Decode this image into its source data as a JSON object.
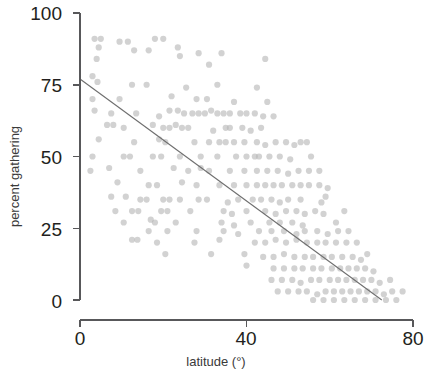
{
  "chart_data": {
    "type": "scatter",
    "title": "",
    "xlabel": "latitude (°)",
    "ylabel": "percent gathering",
    "xlim": [
      0,
      80
    ],
    "ylim": [
      0,
      100
    ],
    "xticks": [
      0,
      40,
      80
    ],
    "yticks": [
      0,
      25,
      50,
      75,
      100
    ],
    "xtick_labels": [
      "0",
      "40",
      "80"
    ],
    "ytick_labels": [
      "0",
      "25",
      "50",
      "75",
      "100"
    ],
    "grid": false,
    "legend": "none",
    "point_color": "#b6b6b6",
    "point_opacity": 0.62,
    "point_radius": 3.1,
    "axis_color": "#58585a",
    "trend_color": "#6e6e6e",
    "trendline": {
      "type": "linear",
      "x_start": 0,
      "y_start": 77,
      "x_end": 72.5,
      "y_end": 0,
      "slope": -1.062,
      "intercept": 77
    },
    "series": [
      {
        "name": "populations",
        "points": [
          [
            3.5,
            91
          ],
          [
            5.0,
            91
          ],
          [
            4.0,
            84
          ],
          [
            4.5,
            88
          ],
          [
            9.5,
            90
          ],
          [
            11.5,
            90
          ],
          [
            18.0,
            91
          ],
          [
            20.0,
            91
          ],
          [
            13.0,
            87
          ],
          [
            16.5,
            87
          ],
          [
            23.5,
            88
          ],
          [
            24.0,
            85
          ],
          [
            28.5,
            86
          ],
          [
            34.0,
            86
          ],
          [
            31.0,
            82
          ],
          [
            44.5,
            84
          ],
          [
            3.0,
            78
          ],
          [
            4.2,
            76
          ],
          [
            3.0,
            70
          ],
          [
            12.5,
            75
          ],
          [
            16.0,
            75
          ],
          [
            25.5,
            74
          ],
          [
            33.0,
            75
          ],
          [
            42.5,
            74
          ],
          [
            9.5,
            70
          ],
          [
            22.0,
            71
          ],
          [
            28.0,
            70
          ],
          [
            30.5,
            70
          ],
          [
            37.0,
            69
          ],
          [
            45.0,
            69
          ],
          [
            3.5,
            66
          ],
          [
            7.5,
            65
          ],
          [
            13.5,
            65
          ],
          [
            19.0,
            64
          ],
          [
            21.5,
            66
          ],
          [
            23.5,
            66
          ],
          [
            25.0,
            65
          ],
          [
            27.0,
            65
          ],
          [
            28.5,
            65
          ],
          [
            30.0,
            65
          ],
          [
            31.5,
            66
          ],
          [
            33.0,
            65
          ],
          [
            34.5,
            65
          ],
          [
            36.0,
            65
          ],
          [
            38.5,
            65
          ],
          [
            40.0,
            65
          ],
          [
            42.0,
            65
          ],
          [
            44.0,
            64
          ],
          [
            46.5,
            64
          ],
          [
            6.5,
            61
          ],
          [
            8.0,
            61
          ],
          [
            10.5,
            60
          ],
          [
            17.5,
            61
          ],
          [
            20.0,
            60
          ],
          [
            21.5,
            60
          ],
          [
            23.0,
            61
          ],
          [
            24.5,
            60
          ],
          [
            26.0,
            60
          ],
          [
            32.0,
            59
          ],
          [
            36.0,
            60
          ],
          [
            39.0,
            60
          ],
          [
            41.0,
            59
          ],
          [
            43.5,
            60
          ],
          [
            4.5,
            56
          ],
          [
            13.0,
            55
          ],
          [
            19.0,
            56
          ],
          [
            20.5,
            55
          ],
          [
            27.5,
            55
          ],
          [
            31.0,
            55
          ],
          [
            33.5,
            55
          ],
          [
            35.0,
            55
          ],
          [
            37.0,
            55
          ],
          [
            39.5,
            55
          ],
          [
            42.5,
            55
          ],
          [
            44.5,
            54
          ],
          [
            47.0,
            55
          ],
          [
            49.5,
            55
          ],
          [
            51.5,
            54
          ],
          [
            53.0,
            55
          ],
          [
            54.5,
            55
          ],
          [
            3.0,
            50
          ],
          [
            10.5,
            50
          ],
          [
            12.0,
            50
          ],
          [
            17.5,
            50
          ],
          [
            19.5,
            50
          ],
          [
            24.0,
            50
          ],
          [
            29.0,
            50
          ],
          [
            33.0,
            50
          ],
          [
            37.5,
            50
          ],
          [
            40.0,
            50
          ],
          [
            42.0,
            50
          ],
          [
            45.5,
            50
          ],
          [
            48.0,
            50
          ],
          [
            50.5,
            49
          ],
          [
            2.5,
            45
          ],
          [
            14.5,
            45
          ],
          [
            22.5,
            46
          ],
          [
            26.0,
            45
          ],
          [
            31.0,
            45
          ],
          [
            36.0,
            45
          ],
          [
            39.5,
            45
          ],
          [
            42.5,
            45
          ],
          [
            45.0,
            45
          ],
          [
            47.5,
            45
          ],
          [
            50.0,
            44
          ],
          [
            52.5,
            45
          ],
          [
            55.0,
            45
          ],
          [
            9.0,
            41
          ],
          [
            16.5,
            40
          ],
          [
            18.5,
            40
          ],
          [
            24.5,
            41
          ],
          [
            28.0,
            40
          ],
          [
            33.5,
            40
          ],
          [
            37.0,
            40
          ],
          [
            40.0,
            40
          ],
          [
            42.5,
            40
          ],
          [
            44.5,
            40
          ],
          [
            46.5,
            40
          ],
          [
            48.5,
            40
          ],
          [
            51.0,
            40
          ],
          [
            53.0,
            40
          ],
          [
            55.0,
            40
          ],
          [
            57.5,
            40
          ],
          [
            59.5,
            39
          ],
          [
            14.5,
            35
          ],
          [
            16.0,
            35
          ],
          [
            20.0,
            35
          ],
          [
            21.5,
            35
          ],
          [
            28.5,
            35
          ],
          [
            30.5,
            35
          ],
          [
            35.5,
            34
          ],
          [
            38.0,
            35
          ],
          [
            41.5,
            35
          ],
          [
            43.5,
            35
          ],
          [
            46.0,
            35
          ],
          [
            48.0,
            34
          ],
          [
            12.5,
            31
          ],
          [
            14.0,
            31
          ],
          [
            19.5,
            31
          ],
          [
            21.0,
            31
          ],
          [
            34.5,
            31
          ],
          [
            36.5,
            30
          ],
          [
            40.0,
            31
          ],
          [
            44.5,
            31
          ],
          [
            47.0,
            30
          ],
          [
            49.5,
            31
          ],
          [
            52.0,
            31
          ],
          [
            54.0,
            30
          ],
          [
            56.5,
            31
          ],
          [
            58.5,
            30
          ],
          [
            10.5,
            27
          ],
          [
            17.0,
            28
          ],
          [
            18.0,
            27
          ],
          [
            34.0,
            27
          ],
          [
            37.0,
            26
          ],
          [
            41.0,
            27
          ],
          [
            45.5,
            27
          ],
          [
            48.0,
            27
          ],
          [
            51.0,
            27
          ],
          [
            53.5,
            26
          ],
          [
            16.5,
            24
          ],
          [
            21.0,
            24
          ],
          [
            34.5,
            24
          ],
          [
            38.0,
            23
          ],
          [
            43.0,
            24
          ],
          [
            46.0,
            24
          ],
          [
            49.0,
            24
          ],
          [
            52.0,
            23
          ],
          [
            54.0,
            24
          ],
          [
            57.0,
            24
          ],
          [
            59.5,
            23
          ],
          [
            62.0,
            24
          ],
          [
            12.5,
            21
          ],
          [
            13.8,
            21
          ],
          [
            18.5,
            20
          ],
          [
            33.5,
            21
          ],
          [
            42.0,
            20
          ],
          [
            44.5,
            20
          ],
          [
            47.0,
            21
          ],
          [
            49.5,
            20
          ],
          [
            52.0,
            21
          ],
          [
            54.5,
            20
          ],
          [
            57.0,
            20
          ],
          [
            59.0,
            20
          ],
          [
            61.5,
            20
          ],
          [
            64.0,
            20
          ],
          [
            20.5,
            16
          ],
          [
            39.5,
            16
          ],
          [
            44.0,
            15
          ],
          [
            46.5,
            15
          ],
          [
            49.0,
            16
          ],
          [
            51.5,
            15
          ],
          [
            54.0,
            15
          ],
          [
            56.0,
            15
          ],
          [
            58.5,
            15
          ],
          [
            60.5,
            15
          ],
          [
            63.0,
            15
          ],
          [
            65.5,
            15
          ],
          [
            67.5,
            14
          ],
          [
            40.0,
            12
          ],
          [
            46.5,
            11
          ],
          [
            49.0,
            11
          ],
          [
            51.5,
            11
          ],
          [
            53.5,
            11
          ],
          [
            56.0,
            11
          ],
          [
            58.0,
            11
          ],
          [
            60.5,
            11
          ],
          [
            62.5,
            11
          ],
          [
            64.5,
            11
          ],
          [
            66.5,
            11
          ],
          [
            68.5,
            11
          ],
          [
            70.5,
            10
          ],
          [
            46.0,
            7
          ],
          [
            48.5,
            7
          ],
          [
            51.0,
            7
          ],
          [
            53.0,
            6
          ],
          [
            55.5,
            7
          ],
          [
            57.5,
            7
          ],
          [
            60.0,
            7
          ],
          [
            62.0,
            7
          ],
          [
            64.0,
            7
          ],
          [
            66.0,
            7
          ],
          [
            68.0,
            7
          ],
          [
            70.0,
            7
          ],
          [
            72.0,
            6
          ],
          [
            74.5,
            7
          ],
          [
            47.5,
            3
          ],
          [
            50.0,
            3
          ],
          [
            52.5,
            3
          ],
          [
            54.5,
            3
          ],
          [
            57.0,
            2
          ],
          [
            59.0,
            3
          ],
          [
            61.0,
            3
          ],
          [
            63.0,
            3
          ],
          [
            65.0,
            3
          ],
          [
            67.0,
            3
          ],
          [
            69.0,
            3
          ],
          [
            71.0,
            3
          ],
          [
            73.0,
            2
          ],
          [
            75.0,
            3
          ],
          [
            77.5,
            3
          ],
          [
            56.0,
            0
          ],
          [
            58.5,
            0
          ],
          [
            61.0,
            0
          ],
          [
            63.5,
            0
          ],
          [
            66.0,
            0
          ],
          [
            68.5,
            0
          ],
          [
            71.0,
            0
          ],
          [
            73.5,
            0
          ],
          [
            76.0,
            0
          ],
          [
            59.0,
            36
          ],
          [
            63.5,
            31
          ],
          [
            61.5,
            27
          ],
          [
            64.5,
            24
          ],
          [
            66.5,
            20
          ],
          [
            69.0,
            16
          ],
          [
            55.5,
            50
          ],
          [
            57.5,
            45
          ],
          [
            58.0,
            34
          ],
          [
            53.0,
            35
          ],
          [
            50.0,
            35
          ],
          [
            43.0,
            50
          ],
          [
            35.0,
            60
          ],
          [
            29.0,
            46
          ],
          [
            7.0,
            46
          ],
          [
            7.5,
            36
          ],
          [
            11.0,
            36
          ],
          [
            26.5,
            31
          ],
          [
            24.0,
            35
          ],
          [
            23.0,
            27
          ],
          [
            28.0,
            24
          ],
          [
            27.5,
            20
          ],
          [
            31.5,
            16
          ],
          [
            8.5,
            31
          ]
        ]
      }
    ]
  },
  "axis_labels": {
    "y": [
      "100",
      "75",
      "50",
      "25",
      "0"
    ],
    "x": [
      "0",
      "40",
      "80"
    ]
  }
}
